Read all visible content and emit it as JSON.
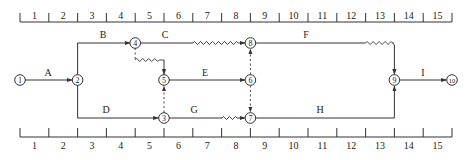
{
  "diagram": {
    "type": "time-scaled network (double-code)",
    "time_scale": {
      "top_labels": [
        "1",
        "2",
        "3",
        "4",
        "5",
        "6",
        "7",
        "8",
        "9",
        "10",
        "11",
        "12",
        "13",
        "14",
        "15"
      ],
      "bottom_labels": [
        "1",
        "2",
        "3",
        "4",
        "5",
        "6",
        "7",
        "8",
        "9",
        "10",
        "11",
        "12",
        "13",
        "14",
        "15"
      ]
    },
    "nodes": [
      {
        "id": "1",
        "label": "1",
        "time": 0,
        "row": "middle"
      },
      {
        "id": "2",
        "label": "2",
        "time": 2,
        "row": "middle"
      },
      {
        "id": "4",
        "label": "4",
        "time": 4,
        "row": "top"
      },
      {
        "id": "5",
        "label": "5",
        "time": 5,
        "row": "middle"
      },
      {
        "id": "3",
        "label": "3",
        "time": 5,
        "row": "bottom"
      },
      {
        "id": "8",
        "label": "8",
        "time": 8,
        "row": "top"
      },
      {
        "id": "6",
        "label": "6",
        "time": 8,
        "row": "middle"
      },
      {
        "id": "7",
        "label": "7",
        "time": 8,
        "row": "bottom"
      },
      {
        "id": "9",
        "label": "9",
        "time": 13,
        "row": "middle"
      },
      {
        "id": "10",
        "label": "10",
        "time": 15,
        "row": "middle"
      }
    ],
    "activities": [
      {
        "name": "A",
        "from": "1",
        "to": "2",
        "duration": 2,
        "free_float": 0
      },
      {
        "name": "B",
        "from": "2",
        "to": "4",
        "duration": 2,
        "free_float": 0
      },
      {
        "name": "C",
        "from": "4",
        "to": "8",
        "duration": 2,
        "free_float": 2
      },
      {
        "name": "D",
        "from": "2",
        "to": "3",
        "duration": 3,
        "free_float": 0
      },
      {
        "name": "E",
        "from": "5",
        "to": "6",
        "duration": 3,
        "free_float": 0
      },
      {
        "name": "F",
        "from": "8",
        "to": "9",
        "duration": 4,
        "free_float": 1
      },
      {
        "name": "G",
        "from": "3",
        "to": "7",
        "duration": 2,
        "free_float": 1
      },
      {
        "name": "H",
        "from": "7",
        "to": "9",
        "duration": 5,
        "free_float": 0
      },
      {
        "name": "I",
        "from": "9",
        "to": "10",
        "duration": 2,
        "free_float": 0
      }
    ],
    "dummies": [
      {
        "from": "4",
        "to": "5",
        "free_float": 1
      },
      {
        "from": "3",
        "to": "5",
        "free_float": 0
      },
      {
        "from": "6",
        "to": "8",
        "free_float": 0
      },
      {
        "from": "6",
        "to": "7",
        "free_float": 0
      }
    ]
  }
}
